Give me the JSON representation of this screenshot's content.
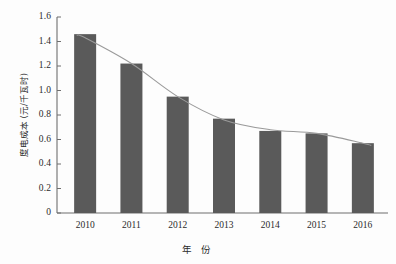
{
  "chart_data": {
    "type": "bar",
    "title": "",
    "subtitle": "",
    "xlabel": "年 份",
    "ylabel": "度电成本 (元/千瓦时)",
    "categories": [
      "2010",
      "2011",
      "2012",
      "2013",
      "2014",
      "2015",
      "2016"
    ],
    "values": [
      1.46,
      1.22,
      0.95,
      0.77,
      0.67,
      0.65,
      0.57
    ],
    "series": [
      {
        "name": "度电成本",
        "type": "bar",
        "values": [
          1.46,
          1.22,
          0.95,
          0.77,
          0.67,
          0.65,
          0.57
        ]
      },
      {
        "name": "趋势线",
        "type": "line",
        "values": [
          1.43,
          1.22,
          0.95,
          0.76,
          0.68,
          0.65,
          0.57
        ]
      }
    ],
    "ylim": [
      0,
      1.6
    ],
    "ytick_labels": [
      "0",
      "0.2",
      "0.4",
      "0.6",
      "0.8",
      "1.0",
      "1.2",
      "1.4",
      "1.6"
    ],
    "ytick_values": [
      0,
      0.2,
      0.4,
      0.6,
      0.8,
      1.0,
      1.2,
      1.4,
      1.6
    ],
    "grid": false,
    "legend": false,
    "legend_position": "none",
    "bar_color": "#5a5a5a",
    "line_color": "#9a9a9a",
    "axis_color": "#6f6f6f",
    "text_color": "#2b2b2b",
    "background_color": "#fdfdfd"
  }
}
